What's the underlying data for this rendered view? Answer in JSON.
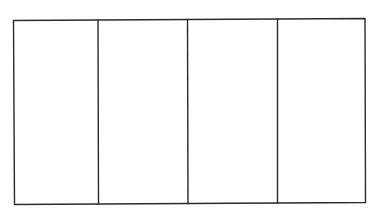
{
  "diagram": {
    "type": "rectangle-divided-into-vertical-panels",
    "panel_count": 4,
    "stroke_color": "#2a2a2a",
    "background_color": "#ffffff",
    "outer_box": {
      "left": 13,
      "top": 19,
      "right": 365,
      "bottom": 204
    },
    "dividers_x": [
      98,
      188,
      277
    ],
    "panels": [
      {
        "label": ""
      },
      {
        "label": ""
      },
      {
        "label": ""
      },
      {
        "label": ""
      }
    ]
  }
}
